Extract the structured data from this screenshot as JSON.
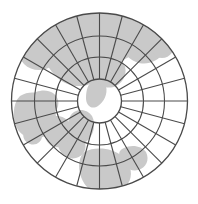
{
  "figure": {
    "kind": "polar-azimuthal-world-map-graticule",
    "title": "",
    "width": 198,
    "height": 204,
    "background_color": "#ffffff",
    "land_fill_color": "#c9c9c9",
    "ocean_fill_color": "#ffffff",
    "graticule_color": "#4a4a4a",
    "outline_color": "#4a4a4a",
    "graticule_line_width": 1.1,
    "outline_line_width": 1.3
  },
  "projection": {
    "center_x": 99.5,
    "center_y": 101.0,
    "outer_radius": 88,
    "inner_hole_radius": 22,
    "parallel_radii": [
      22,
      44,
      65,
      88
    ],
    "parallel_count": 4,
    "meridian_count": 24,
    "meridian_spacing_degrees": 15,
    "rotation_offset_degrees": 0
  },
  "landmasses": [
    {
      "name": "eurasia-north",
      "fill": "#c9c9c9",
      "path": "M 52 16 C 66 10 84 8 102 10 C 116 12 128 18 136 26 C 142 32 144 40 140 48 C 134 56 122 60 112 66 C 104 72 98 80 90 84 C 80 88 68 86 60 80 C 52 74 46 64 42 54 C 38 42 40 26 52 16 Z"
    },
    {
      "name": "europe-west-coast",
      "fill": "#c9c9c9",
      "path": "M 24 42 C 34 36 46 36 54 42 C 60 48 60 58 54 64 C 46 72 32 72 24 64 C 18 58 18 48 24 42 Z"
    },
    {
      "name": "north-america-arctic",
      "fill": "#c9c9c9",
      "path": "M 118 18 C 132 12 148 14 158 22 C 166 30 168 42 164 52 C 158 62 146 66 136 62 C 126 58 120 48 118 38 C 116 30 114 22 118 18 Z"
    },
    {
      "name": "central-asia-interior",
      "fill": "#c9c9c9",
      "path": "M 60 54 C 72 48 86 48 96 54 C 104 60 106 70 100 78 C 92 86 78 86 68 80 C 60 74 54 62 60 54 Z"
    },
    {
      "name": "japan-arc-near-pole",
      "fill": "#c9c9c9",
      "path": "M 92 82 C 98 78 104 80 106 86 C 108 94 104 102 98 106 C 92 110 86 106 86 98 C 86 90 88 84 92 82 Z"
    },
    {
      "name": "southeast-asia-peninsula",
      "fill": "#c9c9c9",
      "path": "M 74 112 C 80 108 88 110 92 116 C 96 124 94 134 88 140 C 82 146 74 144 70 136 C 66 126 68 116 74 112 Z"
    },
    {
      "name": "africa-west",
      "fill": "#c9c9c9",
      "path": "M 20 96 C 30 90 42 92 50 100 C 58 110 58 124 50 132 C 40 142 26 140 18 130 C 12 120 12 104 20 96 Z"
    },
    {
      "name": "australia",
      "fill": "#c9c9c9",
      "path": "M 84 152 C 96 146 112 148 122 156 C 132 164 134 178 126 186 C 116 196 98 196 88 188 C 78 178 76 160 84 152 Z"
    },
    {
      "name": "indonesia-archipelago",
      "fill": "#c9c9c9",
      "path": "M 62 136 C 70 132 80 134 84 140 C 88 148 84 156 76 158 C 68 160 60 154 58 146 C 56 140 58 138 62 136 Z"
    },
    {
      "name": "new-guinea",
      "fill": "#c9c9c9",
      "path": "M 124 148 C 132 144 142 146 146 152 C 150 160 146 168 138 170 C 130 172 122 166 120 158 C 118 152 120 150 124 148 Z"
    },
    {
      "name": "south-asia-subcontinent",
      "fill": "#c9c9c9",
      "path": "M 48 118 C 56 114 66 116 70 124 C 74 132 70 142 62 146 C 54 150 46 144 44 134 C 42 126 44 120 48 118 Z"
    },
    {
      "name": "greenland-fragment",
      "fill": "#c9c9c9",
      "path": "M 140 20 C 150 16 160 20 162 28 C 164 36 158 44 150 44 C 142 44 136 36 136 28 C 136 24 138 22 140 20 Z"
    },
    {
      "name": "siberia-coast-fragment",
      "fill": "#c9c9c9",
      "path": "M 98 14 C 110 10 124 12 130 20 C 136 28 132 38 124 42 C 114 46 102 42 96 34 C 92 26 92 18 98 14 Z"
    },
    {
      "name": "alaska-fragment",
      "fill": "#c9c9c9",
      "path": "M 156 34 C 164 30 172 34 174 42 C 176 50 170 58 162 58 C 154 58 150 50 150 42 C 150 38 152 36 156 34 Z"
    },
    {
      "name": "china-east-coast",
      "fill": "#c9c9c9",
      "path": "M 100 56 C 110 52 120 56 124 64 C 128 72 124 82 116 86 C 108 90 98 86 94 78 C 90 70 94 60 100 56 Z"
    },
    {
      "name": "india-ocean-island",
      "fill": "#c9c9c9",
      "path": "M 30 128 C 36 126 42 130 42 136 C 42 142 36 146 30 144 C 24 142 22 136 24 132 C 26 129 28 128 30 128 Z"
    },
    {
      "name": "arabian-peninsula",
      "fill": "#c9c9c9",
      "path": "M 36 92 C 46 88 56 92 58 100 C 60 108 54 116 46 116 C 38 116 32 108 32 100 C 32 96 34 93 36 92 Z"
    },
    {
      "name": "antarctic-fragment-south",
      "fill": "#c9c9c9",
      "path": "M 150 176 C 158 172 166 176 166 184 C 166 192 158 196 150 194 C 144 192 142 184 144 180 C 146 177 148 176 150 176 Z"
    }
  ],
  "labels": {
    "visible_text": []
  },
  "legend": {
    "entries": [],
    "position": "none"
  }
}
